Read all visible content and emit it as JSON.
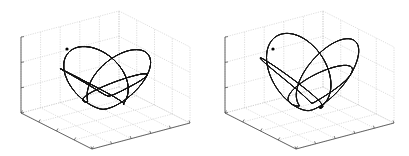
{
  "chart_data": [
    {
      "type": "line",
      "subtype": "3d-trajectory",
      "title": "",
      "xlabel": "",
      "ylabel": "",
      "zlabel": "",
      "tick_labels_shown": false,
      "grid": true,
      "z_ticks": 4,
      "x_ticks": 4,
      "y_ticks": 5,
      "line_color": "#111111",
      "grid_color": "#c8c8c8",
      "description": "Rosette-like closed-loop trajectory inside a bowl-shaped surface, many overlapping petal loops",
      "start_marker": true,
      "params": {
        "lobes": 13,
        "turns": 26,
        "rim_ratio": 0.92,
        "inner_ratio": 0.35,
        "depth": 1.0,
        "phase": 0.0
      }
    },
    {
      "type": "line",
      "subtype": "3d-trajectory",
      "title": "",
      "xlabel": "",
      "ylabel": "",
      "zlabel": "",
      "tick_labels_shown": false,
      "grid": true,
      "z_ticks": 4,
      "x_ticks": 4,
      "y_ticks": 5,
      "line_color": "#111111",
      "grid_color": "#c8c8c8",
      "description": "Rosette-like trajectory inside a wider, deeper bowl with loops concentrated near rim",
      "start_marker": true,
      "params": {
        "lobes": 11,
        "turns": 22,
        "rim_ratio": 1.0,
        "inner_ratio": 0.2,
        "depth": 1.1,
        "phase": 0.3
      }
    }
  ]
}
